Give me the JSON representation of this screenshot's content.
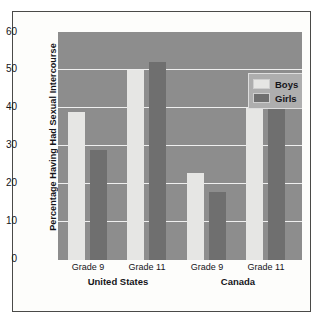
{
  "chart_data": {
    "type": "bar",
    "title": "",
    "subtitle": "",
    "xlabel": "",
    "ylabel": "Percentage Having Had Sexual Intercourse",
    "ylim": [
      0,
      60
    ],
    "yticks": [
      0,
      10,
      20,
      30,
      40,
      50,
      60
    ],
    "ytick_labels": [
      "0",
      "10",
      "20",
      "30",
      "40",
      "50",
      "60"
    ],
    "grid": true,
    "legend_position": "top-right",
    "categories": [
      "Grade 9",
      "Grade 11",
      "Grade 9",
      "Grade 11"
    ],
    "groups": [
      {
        "label": "United States",
        "categories": [
          "Grade 9",
          "Grade 11"
        ],
        "boys": [
          39,
          50
        ],
        "girls": [
          29,
          52
        ]
      },
      {
        "label": "Canada",
        "categories": [
          "Grade 9",
          "Grade 11"
        ],
        "boys": [
          23,
          40
        ],
        "girls": [
          18,
          46
        ]
      }
    ],
    "series": [
      {
        "name": "Boys",
        "values": [
          39,
          50,
          23,
          40
        ],
        "color": "#e6e6e4"
      },
      {
        "name": "Girls",
        "values": [
          29,
          52,
          18,
          46
        ],
        "color": "#6f6f6f"
      }
    ],
    "bars": [
      {
        "group": "United States",
        "category": "Grade 9",
        "series": "Boys",
        "value": 39
      },
      {
        "group": "United States",
        "category": "Grade 9",
        "series": "Girls",
        "value": 29
      },
      {
        "group": "United States",
        "category": "Grade 11",
        "series": "Boys",
        "value": 50
      },
      {
        "group": "United States",
        "category": "Grade 11",
        "series": "Girls",
        "value": 52
      },
      {
        "group": "Canada",
        "category": "Grade 9",
        "series": "Boys",
        "value": 23
      },
      {
        "group": "Canada",
        "category": "Grade 9",
        "series": "Girls",
        "value": 18
      },
      {
        "group": "Canada",
        "category": "Grade 11",
        "series": "Boys",
        "value": 40
      },
      {
        "group": "Canada",
        "category": "Grade 11",
        "series": "Girls",
        "value": 46
      }
    ]
  },
  "legend": {
    "items": [
      {
        "label": "Boys",
        "color": "#e6e6e4"
      },
      {
        "label": "Girls",
        "color": "#6f6f6f"
      }
    ]
  },
  "axis": {
    "y_title": "Percentage Having Had Sexual Intercourse",
    "y_ticks": [
      "60",
      "50",
      "40",
      "30",
      "20",
      "10",
      "0"
    ],
    "x_ticks": [
      "Grade 9",
      "Grade 11",
      "Grade 9",
      "Grade 11"
    ],
    "x_groups": [
      "United States",
      "Canada"
    ]
  },
  "colors": {
    "plot_background": "#8d8d8d",
    "gridline": "#efefef",
    "boys_bar": "#e6e6e4",
    "girls_bar": "#6f6f6f",
    "frame_border": "#4a4a48",
    "page_background": "#ffffff",
    "text": "#15151a"
  }
}
